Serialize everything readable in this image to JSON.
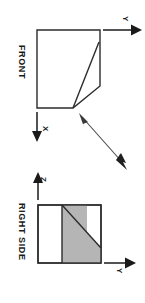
{
  "drawing": {
    "type": "orthographic-projection",
    "orientation_deg": 90,
    "background_color": "#ffffff",
    "line_color": "#2b2b2b",
    "shade_color": "#b5b5b5"
  },
  "views": [
    {
      "id": "front",
      "title": "FRONT",
      "axes": [
        {
          "name": "Y",
          "label": "Y",
          "direction": "right"
        },
        {
          "name": "X",
          "label": "X",
          "direction": "down"
        }
      ]
    },
    {
      "id": "right-side",
      "title": "RIGHT SIDE",
      "axes": [
        {
          "name": "Z",
          "label": "Z",
          "direction": "up"
        },
        {
          "name": "Y",
          "label": "Y",
          "direction": "right"
        }
      ]
    }
  ],
  "annotations": {
    "leader": {
      "name": "leader-arrow",
      "style": "double-headed",
      "description": ""
    }
  }
}
